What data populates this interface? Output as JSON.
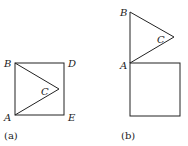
{
  "figures": [
    {
      "caption": "(a)",
      "labels": {
        "B": "B",
        "D": "D",
        "A": "A",
        "E": "E",
        "C": "C"
      }
    },
    {
      "caption": "(b)",
      "labels": {
        "B": "B",
        "A": "A",
        "C": "C"
      }
    }
  ],
  "colors": {
    "stroke": "#222222",
    "background": "#ffffff"
  }
}
